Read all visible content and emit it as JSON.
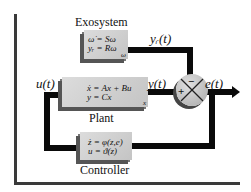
{
  "diagram": {
    "type": "block-diagram",
    "blocks": {
      "exosystem": {
        "title": "Exosystem",
        "equation_1": "ω̇ = Sω",
        "equation_2": "yᵣ = Rω",
        "state": "ω"
      },
      "plant": {
        "title": "Plant",
        "equation_1": "ẋ = Ax + Bu",
        "equation_2": "y = Cx",
        "state": "x"
      },
      "controller": {
        "title": "Controller",
        "equation_1": "ż = φ(z,e)",
        "equation_2": "u = ϑ(z)"
      }
    },
    "summing_junction": {
      "plus_sign": "+",
      "minus_sign": "−"
    },
    "signals": {
      "input": "u(t)",
      "output": "y(t)",
      "reference": "yᵣ(t)",
      "error": "e(t)"
    },
    "colors": {
      "block_fill": "#c8c8c8",
      "wire": "#0a0a0a",
      "shadow": "#555555"
    }
  }
}
